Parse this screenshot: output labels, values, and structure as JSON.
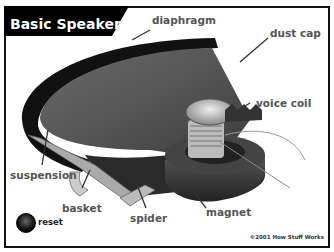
{
  "title": "Basic Speaker",
  "labels": {
    "diaphragm": "diaphragm",
    "dust_cap": "dust cap",
    "voice_coil": "voice coil",
    "suspension": "suspension",
    "basket": "basket",
    "spider": "spider",
    "magnet": "magnet"
  },
  "controls": {
    "reset_label": "reset"
  },
  "copyright": "©2001 How Stuff Works",
  "colors": {
    "banner": "#000000",
    "label_text": "#555555",
    "cone_dark": "#3a3a3a",
    "cone_mid": "#5a5a5a"
  }
}
